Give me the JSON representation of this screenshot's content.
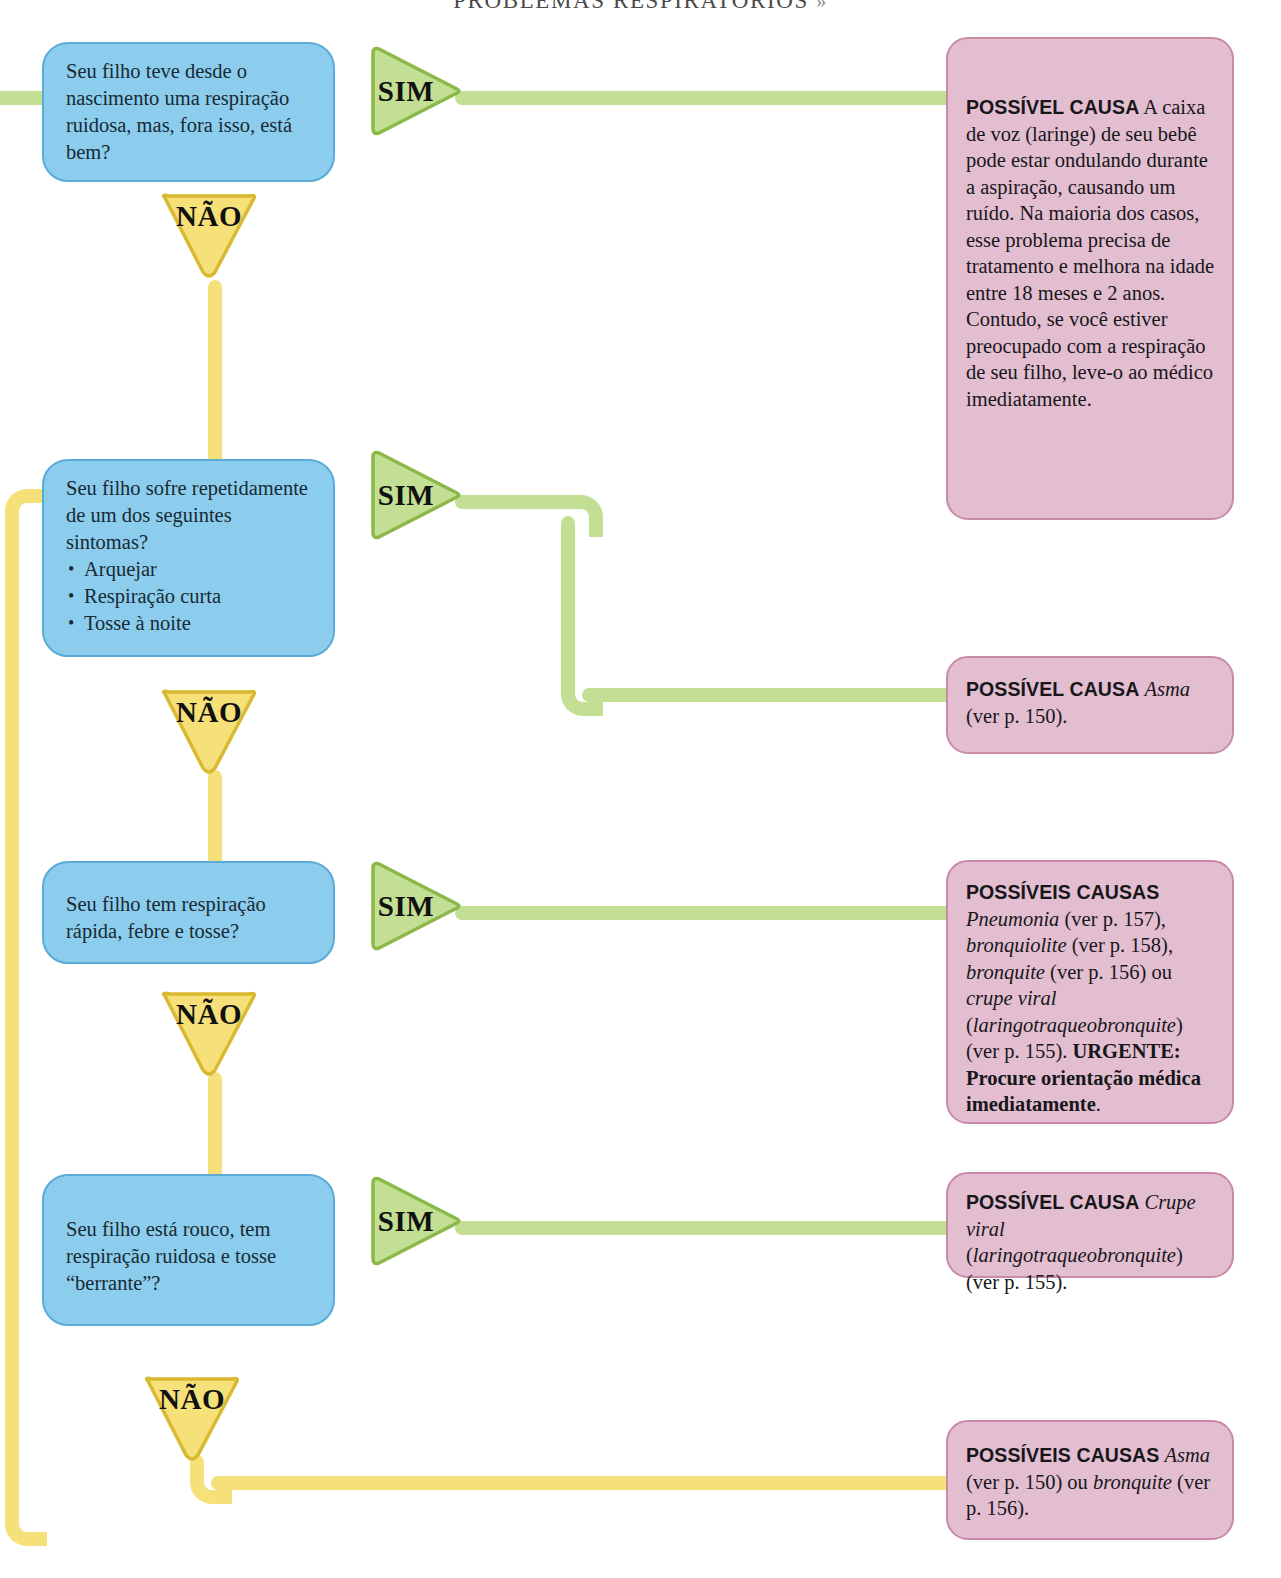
{
  "header": {
    "title": "PROBLEMAS RESPIRATÓRIOS",
    "marker": "»"
  },
  "labels": {
    "yes": "SIM",
    "no": "NÃO"
  },
  "colors": {
    "question_fill": "#8CCDEE",
    "question_border": "#5AABD8",
    "answer_fill": "#E3BDD0",
    "answer_border": "#C98AA6",
    "yes_fill": "#C2DF94",
    "yes_border": "#8CB84A",
    "no_fill": "#F6E07A",
    "no_border": "#D9B930",
    "connector_green": "#C2DF94",
    "connector_yellow": "#F6E07A"
  },
  "questions": [
    {
      "id": "q1",
      "text": "Seu filho teve desde o nascimento uma respiração ruidosa, mas, fora isso, está bem?"
    },
    {
      "id": "q2",
      "text": "Seu filho sofre repetidamente de um dos seguintes sintomas?",
      "bullets": [
        "Arquejar",
        "Respiração curta",
        "Tosse à noite"
      ]
    },
    {
      "id": "q3",
      "text": "Seu filho tem respiração rápida, febre e tosse?"
    },
    {
      "id": "q4",
      "text": "Seu filho está rouco, tem respiração ruidosa e tosse “berrante”?"
    }
  ],
  "answers": [
    {
      "id": "a1",
      "heading": "POSSÍVEL CAUSA",
      "body": " A caixa de voz (laringe) de seu bebê pode estar ondulando durante a aspiração, causando um ruído. Na maioria dos casos, esse problema precisa de tratamento e melhora na idade entre 18 meses e 2 anos. Contudo, se você estiver preocupado com a respiração de seu filho, leve-o ao médico imediatamente."
    },
    {
      "id": "a2",
      "heading": "POSSÍVEL CAUSA",
      "italic1": "Asma",
      "body": " (ver p. 150)."
    },
    {
      "id": "a3",
      "heading": "POSSÍVEIS CAUSAS",
      "it1": "Pneumonia",
      "t1": " (ver p. 157), ",
      "it2": "bronquiolite",
      "t2": " (ver p. 158), ",
      "it3": "bronquite",
      "t3": " (ver p. 156) ou ",
      "it4": "crupe viral",
      "t4": " (",
      "it5": "laringotraqueobronquite",
      "t5": ") (ver p. 155). ",
      "urgent": "URGENTE: Procure orientação médica imediatamente",
      "t6": "."
    },
    {
      "id": "a4",
      "heading": "POSSÍVEL CAUSA",
      "it1": "Crupe viral",
      "t1": " (",
      "it2": "laringotraqueobronquite",
      "t2": ") (ver p. 155)."
    },
    {
      "id": "a5",
      "heading": "POSSÍVEIS CAUSAS",
      "it1": "Asma",
      "t1": " (ver p. 150) ou ",
      "it2": "bronquite",
      "t2": " (ver p. 156)."
    }
  ]
}
